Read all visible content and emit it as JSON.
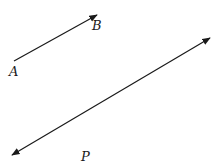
{
  "diagram": {
    "type": "vectors",
    "stroke_color": "#1a1a1a",
    "background": "#ffffff",
    "segment_ab": {
      "from": {
        "label": "A",
        "x": 14,
        "y": 61
      },
      "to": {
        "label": "B",
        "x": 97,
        "y": 15
      },
      "arrowheads": [
        "end"
      ]
    },
    "line_p": {
      "label": "P",
      "from": {
        "x": 12,
        "y": 155
      },
      "to": {
        "x": 210,
        "y": 38
      },
      "arrowheads": [
        "start",
        "end"
      ]
    },
    "labels": {
      "a": "A",
      "b": "B",
      "p": "P"
    }
  }
}
